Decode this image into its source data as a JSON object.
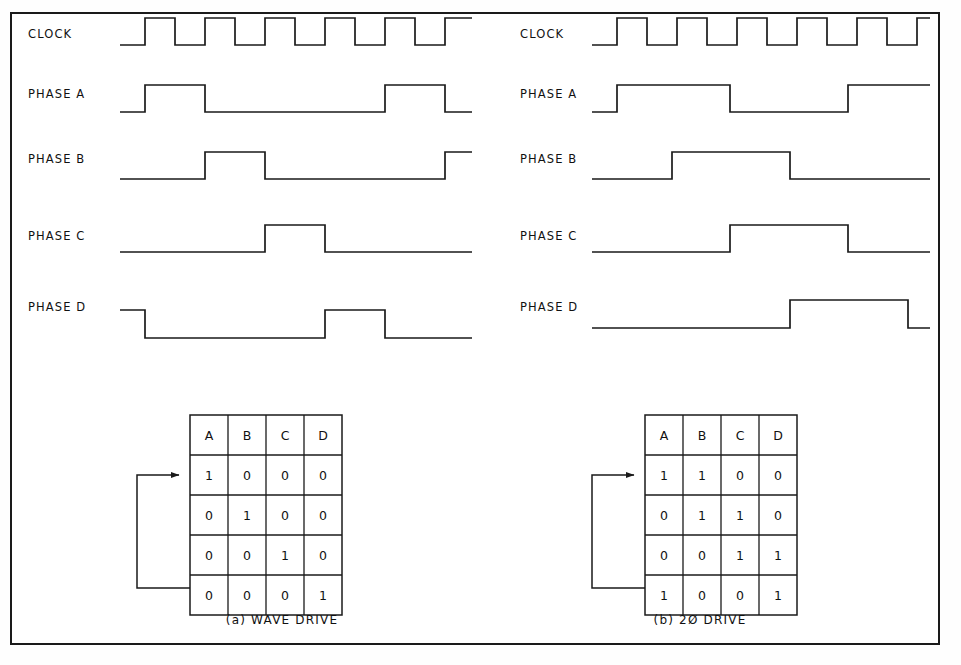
{
  "figure": {
    "border_color": "#1a1a1a",
    "ink_color": "#1a1a1a",
    "footer_text": ""
  },
  "panels": [
    {
      "id": "wave-drive",
      "caption": "(a) WAVE DRIVE",
      "caption_x": 282,
      "caption_y": 624,
      "origin_x": 120,
      "end_x": 472,
      "clock_period": 60,
      "clock_pulses": 6,
      "clock_first_rise": 145,
      "labels": [
        "CLOCK",
        "PHASE A",
        "PHASE B",
        "PHASE C",
        "PHASE D"
      ],
      "label_x": 28,
      "rows": [
        {
          "name": "CLOCK",
          "label_y": 38,
          "top_y": 18,
          "base_y": 45,
          "start_level": 0,
          "edges": [
            145,
            175,
            205,
            235,
            265,
            295,
            325,
            355,
            385,
            415,
            445
          ]
        },
        {
          "name": "PHASE A",
          "label_y": 98,
          "top_y": 85,
          "base_y": 112,
          "start_level": 0,
          "edges": [
            145,
            205,
            385,
            445
          ]
        },
        {
          "name": "PHASE B",
          "label_y": 163,
          "top_y": 152,
          "base_y": 179,
          "start_level": 0,
          "edges": [
            205,
            265,
            445
          ]
        },
        {
          "name": "PHASE C",
          "label_y": 240,
          "top_y": 225,
          "base_y": 252,
          "start_level": 0,
          "edges": [
            265,
            325
          ]
        },
        {
          "name": "PHASE D",
          "label_y": 311,
          "top_y": 310,
          "base_y": 338,
          "start_level": 1,
          "edges": [
            145,
            325,
            385
          ]
        }
      ],
      "table": {
        "x": 190,
        "y": 415,
        "col_w": 38,
        "row_h": 40,
        "header_h": 40,
        "headers": [
          "A",
          "B",
          "C",
          "D"
        ],
        "rows": [
          [
            "1",
            "0",
            "0",
            "0"
          ],
          [
            "0",
            "1",
            "0",
            "0"
          ],
          [
            "0",
            "0",
            "1",
            "0"
          ],
          [
            "0",
            "0",
            "0",
            "1"
          ]
        ]
      },
      "loop": {
        "left_x": 137,
        "arrow_y": 475,
        "bottom_y": 588,
        "tip_x": 188
      }
    },
    {
      "id": "two-phase-drive",
      "caption": "(b) 2Ø DRIVE",
      "caption_x": 700,
      "caption_y": 624,
      "origin_x": 592,
      "end_x": 930,
      "clock_period": 60,
      "clock_pulses": 6,
      "clock_first_rise": 617,
      "labels": [
        "CLOCK",
        "PHASE A",
        "PHASE B",
        "PHASE C",
        "PHASE D"
      ],
      "label_x": 520,
      "rows": [
        {
          "name": "CLOCK",
          "label_y": 38,
          "top_y": 18,
          "base_y": 45,
          "start_level": 0,
          "edges": [
            617,
            647,
            677,
            707,
            737,
            767,
            797,
            827,
            857,
            887,
            917
          ]
        },
        {
          "name": "PHASE A",
          "label_y": 98,
          "top_y": 85,
          "base_y": 112,
          "start_level": 0,
          "edges": [
            617,
            730,
            848
          ]
        },
        {
          "name": "PHASE B",
          "label_y": 163,
          "top_y": 152,
          "base_y": 179,
          "start_level": 0,
          "edges": [
            672,
            790
          ]
        },
        {
          "name": "PHASE C",
          "label_y": 240,
          "top_y": 225,
          "base_y": 252,
          "start_level": 0,
          "edges": [
            730,
            848
          ]
        },
        {
          "name": "PHASE D",
          "label_y": 311,
          "top_y": 300,
          "base_y": 328,
          "start_level": 0,
          "edges": [
            790,
            908
          ]
        }
      ],
      "table": {
        "x": 645,
        "y": 415,
        "col_w": 38,
        "row_h": 40,
        "header_h": 40,
        "headers": [
          "A",
          "B",
          "C",
          "D"
        ],
        "rows": [
          [
            "1",
            "1",
            "0",
            "0"
          ],
          [
            "0",
            "1",
            "1",
            "0"
          ],
          [
            "0",
            "0",
            "1",
            "1"
          ],
          [
            "1",
            "0",
            "0",
            "1"
          ]
        ]
      },
      "loop": {
        "left_x": 592,
        "arrow_y": 475,
        "bottom_y": 588,
        "tip_x": 643
      }
    }
  ]
}
